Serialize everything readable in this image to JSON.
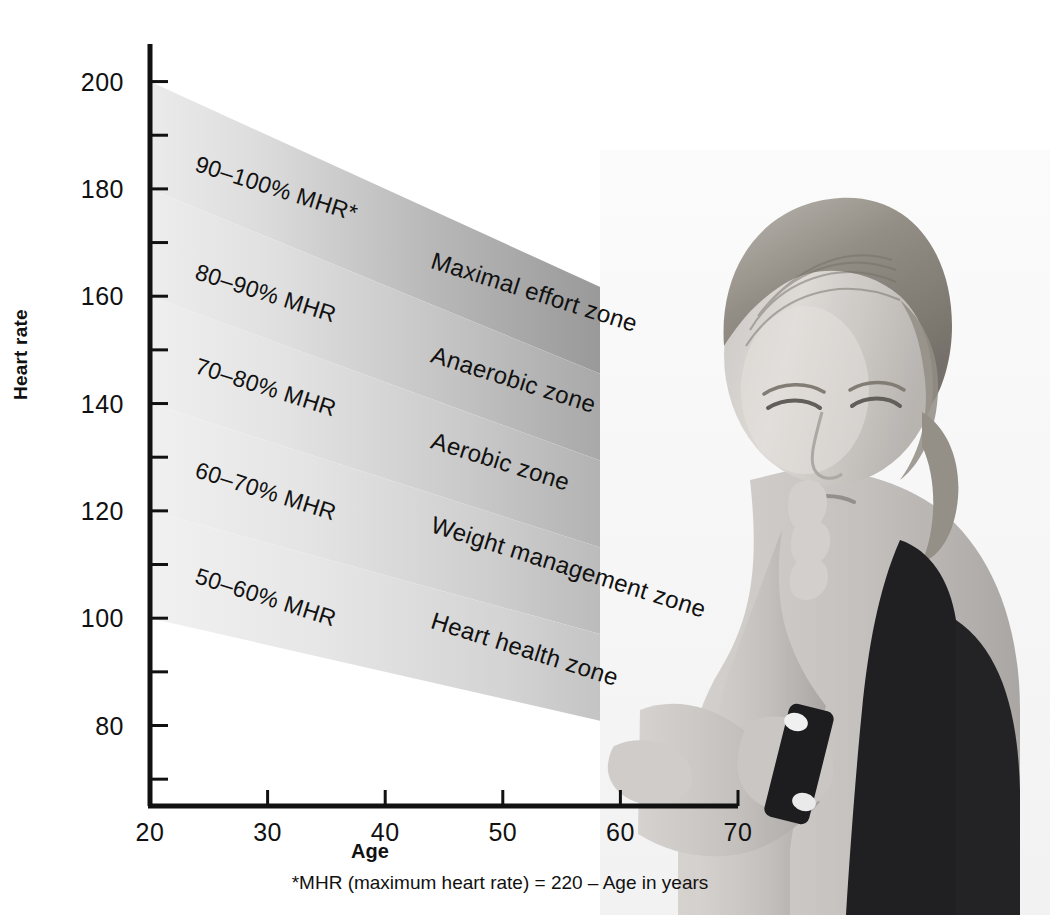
{
  "chart_data": {
    "type": "area",
    "title": "",
    "xlabel": "Age",
    "ylabel": "Heart rate",
    "xlim": [
      20,
      70
    ],
    "ylim": [
      65,
      207
    ],
    "grid": false,
    "legend": "inline-band-labels",
    "footnote": "*MHR (maximum heart rate) = 220 – Age in years",
    "x_ticks": [
      20,
      30,
      40,
      50,
      60,
      70
    ],
    "y_ticks": [
      80,
      100,
      120,
      140,
      160,
      180,
      200
    ],
    "y_minor_ticks": [
      70,
      90,
      110,
      130,
      150,
      170,
      190
    ],
    "formula": "MHR = 220 - Age",
    "note": "Each band is bounded by a percentage of MHR; at age 20 MHR=200, at age 70 MHR=150.",
    "series": [
      {
        "name": "90–100% MHR",
        "zone": "Maximal effort zone",
        "pct_low": 90,
        "pct_high": 100,
        "y_at_age20": [
          180,
          200
        ],
        "y_at_age70": [
          135,
          150
        ],
        "fill_left": "#e9e9e9",
        "fill_right": "#8d8d8d"
      },
      {
        "name": "80–90% MHR",
        "zone": "Anaerobic zone",
        "pct_low": 80,
        "pct_high": 90,
        "y_at_age20": [
          160,
          180
        ],
        "y_at_age70": [
          120,
          135
        ],
        "fill_left": "#ececec",
        "fill_right": "#999999"
      },
      {
        "name": "70–80% MHR",
        "zone": "Aerobic zone",
        "pct_low": 70,
        "pct_high": 80,
        "y_at_age20": [
          140,
          160
        ],
        "y_at_age70": [
          105,
          120
        ],
        "fill_left": "#eeeeee",
        "fill_right": "#a5a5a5"
      },
      {
        "name": "60–70% MHR",
        "zone": "Weight management zone",
        "pct_low": 60,
        "pct_high": 70,
        "y_at_age20": [
          120,
          140
        ],
        "y_at_age70": [
          90,
          105
        ],
        "fill_left": "#efefef",
        "fill_right": "#acacac"
      },
      {
        "name": "50–60% MHR",
        "zone": "Heart health zone",
        "pct_low": 50,
        "pct_high": 60,
        "y_at_age20": [
          100,
          120
        ],
        "y_at_age70": [
          75,
          90
        ],
        "fill_left": "#f0f0f0",
        "fill_right": "#b3b3b3"
      }
    ]
  },
  "axes": {
    "y_title": "Heart rate",
    "x_title": "Age",
    "y_tick_labels": [
      "200",
      "180",
      "160",
      "140",
      "120",
      "100",
      "80"
    ],
    "x_tick_labels": [
      "20",
      "30",
      "40",
      "50",
      "60",
      "70"
    ]
  },
  "band_labels": {
    "pct": [
      "90–100% MHR*",
      "80–90% MHR",
      "70–80% MHR",
      "60–70% MHR",
      "50–60% MHR"
    ],
    "zones": [
      "Maximal effort zone",
      "Anaerobic zone",
      "Aerobic zone",
      "Weight management zone",
      "Heart health zone"
    ]
  },
  "footnote": "*MHR (maximum heart rate) = 220 – Age in years",
  "photo": {
    "alt": "woman-checking-wrist-watch",
    "description": "Grayscale photograph of a woman in a black sports top looking down at her wrist"
  },
  "colors": {
    "axis": "#111111",
    "text": "#111111",
    "background": "#ffffff",
    "band_light": "#efefef",
    "band_dark": "#8d8d8d",
    "separator": "#ffffff"
  }
}
